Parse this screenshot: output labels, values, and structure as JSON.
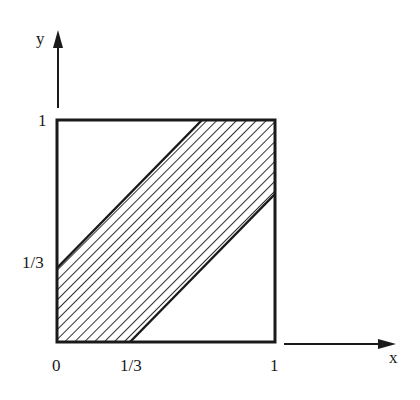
{
  "diagram": {
    "axes": {
      "x_label": "x",
      "y_label": "y"
    },
    "ticks": {
      "x": [
        "0",
        "1/3",
        "1"
      ],
      "y": [
        "1/3",
        "1"
      ]
    },
    "region": {
      "description": "Shaded band |x - y| < 1/3 inside unit square",
      "lower_boundary": {
        "from": [
          0.3333,
          0
        ],
        "to": [
          1,
          0.6667
        ]
      },
      "upper_boundary": {
        "from": [
          0,
          0.3333
        ],
        "to": [
          0.6667,
          1
        ]
      },
      "fill": "hatched"
    },
    "colors": {
      "ink": "#1a1a1a",
      "background": "#ffffff"
    }
  }
}
